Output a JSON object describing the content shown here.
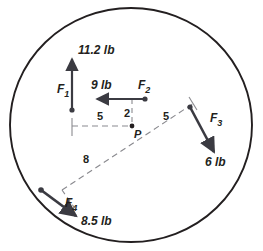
{
  "figure": {
    "point_label": "P",
    "boundary": "circle",
    "colors": {
      "stroke": "#231f20",
      "vector": "#3b3b42",
      "dashed": "#8a8a8f",
      "background": "#ffffff"
    }
  },
  "forces": [
    {
      "id": "F1",
      "name": "F",
      "subscript": "1",
      "magnitude": "11.2",
      "unit": "lb",
      "magnitude_label": "11.2 lb",
      "direction": "up"
    },
    {
      "id": "F2",
      "name": "F",
      "subscript": "2",
      "magnitude": "9",
      "unit": "lb",
      "magnitude_label": "9 lb",
      "direction": "left"
    },
    {
      "id": "F3",
      "name": "F",
      "subscript": "3",
      "magnitude": "6",
      "unit": "lb",
      "magnitude_label": "6 lb",
      "direction": "down-right"
    },
    {
      "id": "F4",
      "name": "F",
      "subscript": "4",
      "magnitude": "8.5",
      "unit": "lb",
      "magnitude_label": "8.5 lb",
      "direction": "down-right-lower-left-origin"
    }
  ],
  "dimensions": [
    {
      "id": "d-left",
      "value": "5",
      "orientation": "horizontal"
    },
    {
      "id": "d-mid",
      "value": "2",
      "orientation": "vertical"
    },
    {
      "id": "d-right",
      "value": "5",
      "orientation": "diagonal-upper-right"
    },
    {
      "id": "d-lower",
      "value": "8",
      "orientation": "diagonal-lower-left"
    }
  ]
}
